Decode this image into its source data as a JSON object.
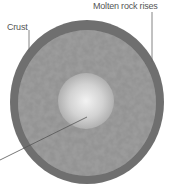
{
  "labels": {
    "crust": "Crust",
    "molten_rock": "Molten rock rises"
  },
  "caption": "",
  "colors": {
    "crust": "#6f6f6f",
    "mantle": "#8e8e8e",
    "core_center": "#eeeeee",
    "core_edge": "#b5b5b5",
    "leader_line": "#666666",
    "label_text": "#555555"
  }
}
